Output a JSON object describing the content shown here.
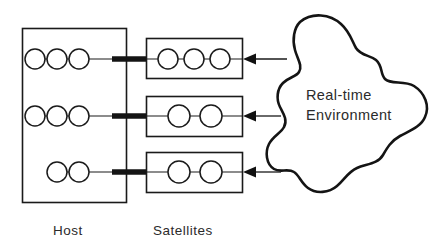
{
  "diagram": {
    "background_color": "#ffffff",
    "line_color": "#1a1a1a",
    "captions": {
      "host": "Host",
      "satellites": "Satellites"
    },
    "environment": {
      "label_line1": "Real-time",
      "label_line2": "Environment",
      "shape": "blob"
    },
    "host": {
      "rows": [
        {
          "node_count": 3,
          "alignment": "left"
        },
        {
          "node_count": 3,
          "alignment": "left"
        },
        {
          "node_count": 2,
          "alignment": "right"
        }
      ]
    },
    "satellites": {
      "boxes": [
        {
          "node_count": 3
        },
        {
          "node_count": 2
        },
        {
          "node_count": 2
        }
      ]
    },
    "links": {
      "host_to_satellite_count": 3,
      "environment_to_satellite_count": 3,
      "arrow_direction": "right-to-left"
    }
  }
}
